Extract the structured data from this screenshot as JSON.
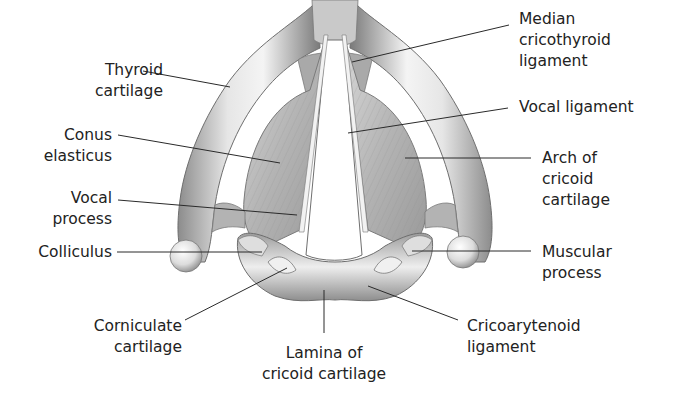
{
  "figure": {
    "colors": {
      "background": "#ffffff",
      "text": "#222222",
      "leader": "#2a2a2a",
      "cartilage": "#bdbdbd"
    }
  },
  "labels": {
    "thyroid_cartilage": {
      "lines": [
        "Thyroid",
        "cartilage"
      ]
    },
    "conus_elasticus": {
      "lines": [
        "Conus",
        "elasticus"
      ]
    },
    "vocal_process": {
      "lines": [
        "Vocal",
        "process"
      ]
    },
    "colliculus": {
      "lines": [
        "Colliculus"
      ]
    },
    "corniculate_cartilage": {
      "lines": [
        "Corniculate",
        "cartilage"
      ]
    },
    "lamina_cricoid": {
      "lines": [
        "Lamina of",
        "cricoid cartilage"
      ]
    },
    "cricoarytenoid_ligament": {
      "lines": [
        "Cricoarytenoid",
        "ligament"
      ]
    },
    "muscular_process": {
      "lines": [
        "Muscular",
        "process"
      ]
    },
    "arch_cricoid": {
      "lines": [
        "Arch of",
        "cricoid",
        "cartilage"
      ]
    },
    "vocal_ligament": {
      "lines": [
        "Vocal ligament"
      ]
    },
    "median_cricothyroid": {
      "lines": [
        "Median",
        "cricothyroid",
        "ligament"
      ]
    }
  }
}
